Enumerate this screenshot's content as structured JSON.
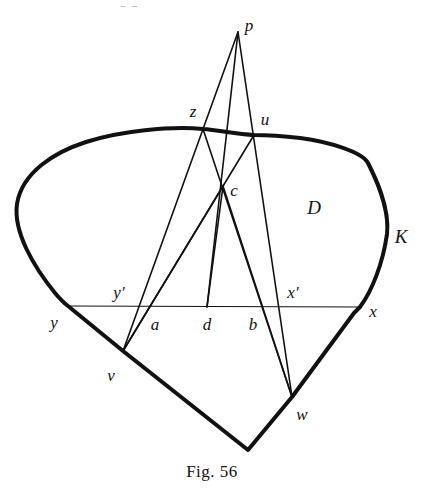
{
  "figure": {
    "caption": "Fig. 56",
    "caption_pos": {
      "x": 212,
      "y": 472
    },
    "region_label": "D",
    "curve_label": "K",
    "background": "#ffffff",
    "ink_color": "#111111",
    "curve_stroke_width": 4,
    "line_stroke_width": 1.6,
    "thin_stroke_width": 1.1,
    "partial_top_text": "p p",
    "points": [
      {
        "id": "p",
        "label": "p",
        "x": 238,
        "y": 32,
        "lx": 249,
        "ly": 25,
        "size": "normal"
      },
      {
        "id": "z",
        "label": "z",
        "x": 203,
        "y": 129,
        "lx": 193,
        "ly": 111,
        "size": "normal"
      },
      {
        "id": "u",
        "label": "u",
        "x": 254,
        "y": 135,
        "lx": 265,
        "ly": 119,
        "size": "normal"
      },
      {
        "id": "c",
        "label": "c",
        "x": 223,
        "y": 186,
        "lx": 234,
        "ly": 190,
        "size": "normal"
      },
      {
        "id": "D",
        "label": "D",
        "x": 314,
        "y": 207,
        "lx": 314,
        "ly": 207,
        "size": "big"
      },
      {
        "id": "K",
        "label": "K",
        "x": 401,
        "y": 236,
        "lx": 401,
        "ly": 236,
        "size": "big"
      },
      {
        "id": "yp",
        "label": "y′",
        "x": 120,
        "y": 307,
        "lx": 119,
        "ly": 292,
        "size": "normal"
      },
      {
        "id": "xp",
        "label": "x′",
        "x": 290,
        "y": 307,
        "lx": 293,
        "ly": 292,
        "size": "normal"
      },
      {
        "id": "y",
        "label": "y",
        "x": 68,
        "y": 306,
        "lx": 54,
        "ly": 322,
        "size": "normal"
      },
      {
        "id": "a",
        "label": "a",
        "x": 152,
        "y": 307,
        "lx": 155,
        "ly": 324,
        "size": "normal"
      },
      {
        "id": "d",
        "label": "d",
        "x": 207,
        "y": 307,
        "lx": 207,
        "ly": 324,
        "size": "normal"
      },
      {
        "id": "b",
        "label": "b",
        "x": 253,
        "y": 307,
        "lx": 253,
        "ly": 324,
        "size": "normal"
      },
      {
        "id": "x",
        "label": "x",
        "x": 360,
        "y": 307,
        "lx": 373,
        "ly": 311,
        "size": "normal"
      },
      {
        "id": "v",
        "label": "v",
        "x": 123,
        "y": 351,
        "lx": 111,
        "ly": 375,
        "size": "normal"
      },
      {
        "id": "w",
        "label": "w",
        "x": 292,
        "y": 397,
        "lx": 302,
        "ly": 414,
        "size": "normal"
      }
    ],
    "closed_curve": {
      "name": "K",
      "path": "M 203 129 C 170 126 120 131 86 142 C 55 152 22 172 17 204 C 13 232 34 267 55 293 C 60 299 64 303 68 306 L 123 351 L 248 450 L 292 397 L 354 313 C 357 310 359 308 360 307 C 372 291 383 263 387 234 C 390 206 374 175 368 163 C 362 152 330 142 300 138 C 283 136 266 135 254 135 C 236 134 218 130 203 129 Z"
    },
    "segments": [
      {
        "name": "p-to-v",
        "from": "p",
        "to": "v",
        "weight": "line"
      },
      {
        "name": "p-to-d",
        "from": "p",
        "to": "d",
        "weight": "line"
      },
      {
        "name": "p-to-w",
        "from": "p",
        "to": "w",
        "weight": "line"
      },
      {
        "name": "z-to-w",
        "from": "z",
        "to": "w",
        "weight": "line"
      },
      {
        "name": "u-to-v",
        "from": "u",
        "to": "v",
        "weight": "line"
      },
      {
        "name": "c-to-v",
        "from": "c",
        "to": "v",
        "weight": "line"
      },
      {
        "name": "c-to-w",
        "from": "c",
        "to": "w",
        "weight": "line"
      },
      {
        "name": "c-to-d",
        "from": "c",
        "to": "d",
        "weight": "line"
      },
      {
        "name": "chord-y-to-x",
        "from": "y",
        "to": "x",
        "weight": "thin"
      }
    ]
  }
}
